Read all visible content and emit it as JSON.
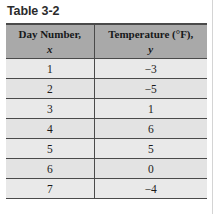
{
  "caption": "Table 3-2",
  "table": {
    "headers": [
      {
        "title": "Day Number,",
        "variable": "x"
      },
      {
        "title": "Temperature (°F),",
        "variable": "y"
      }
    ],
    "rows": [
      {
        "x": "1",
        "y": "−3"
      },
      {
        "x": "2",
        "y": "−5"
      },
      {
        "x": "3",
        "y": "1"
      },
      {
        "x": "4",
        "y": "6"
      },
      {
        "x": "5",
        "y": "5"
      },
      {
        "x": "6",
        "y": "0"
      },
      {
        "x": "7",
        "y": "−4"
      }
    ]
  },
  "colors": {
    "header_background": "#a9a9a9",
    "body_background": "#e9e9e9",
    "rule": "#4a4a4a",
    "caption_text": "#2b2b2b"
  }
}
